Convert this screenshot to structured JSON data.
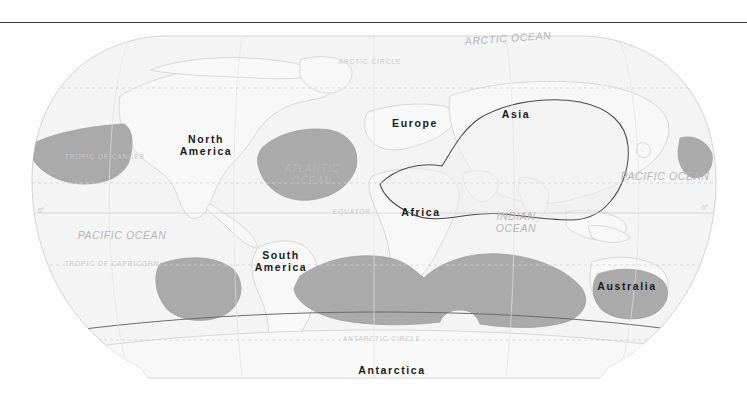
{
  "page": {
    "background": "#ffffff",
    "rule_color": "#3a3a3a"
  },
  "map": {
    "title": "World map with shaded ocean regions",
    "projection": "Robinson",
    "land_fill": "#f6f6f6",
    "ocean_fill": "#f2f2f2",
    "shade_fill": "#aaaaaa",
    "outline_color": "#c9c9c9",
    "grid_color": "#d8d8d8",
    "continents": [
      {
        "id": "north-america",
        "label": "North\nAmerica",
        "lines": [
          "North",
          "America"
        ],
        "x": 205,
        "y": 113
      },
      {
        "id": "south-america",
        "label": "South\nAmerica",
        "lines": [
          "South",
          "America"
        ],
        "x": 281,
        "y": 230
      },
      {
        "id": "europe",
        "label": "Europe",
        "lines": [
          "Europe"
        ],
        "x": 415,
        "y": 99
      },
      {
        "id": "africa",
        "label": "Africa",
        "lines": [
          "Africa"
        ],
        "x": 421,
        "y": 188
      },
      {
        "id": "asia",
        "label": "Asia",
        "lines": [
          "Asia"
        ],
        "x": 516,
        "y": 90
      },
      {
        "id": "australia",
        "label": "Australia",
        "lines": [
          "Australia"
        ],
        "x": 627,
        "y": 262
      },
      {
        "id": "antarctica",
        "label": "Antarctica",
        "lines": [
          "Antarctica"
        ],
        "x": 392,
        "y": 376
      }
    ],
    "oceans": [
      {
        "id": "arctic-ocean",
        "lines": [
          "ARCTIC OCEAN"
        ],
        "x": 508,
        "y": 41
      },
      {
        "id": "atlantic-ocean",
        "lines": [
          "ATLANTIC",
          "OCEAN"
        ],
        "x": 311,
        "y": 171
      },
      {
        "id": "indian-ocean",
        "lines": [
          "INDIAN",
          "OCEAN"
        ],
        "x": 516,
        "y": 219
      },
      {
        "id": "pacific-ocean-west",
        "lines": [
          "PACIFIC OCEAN"
        ],
        "x": 122,
        "y": 238
      },
      {
        "id": "pacific-ocean-east",
        "lines": [
          "PACIFIC OCEAN"
        ],
        "x": 665,
        "y": 179
      }
    ],
    "gridlines": [
      {
        "id": "arctic-circle",
        "label": "ARCTIC CIRCLE",
        "x": 370,
        "y": 64,
        "line_y": 62,
        "style": "dashed"
      },
      {
        "id": "tropic-of-cancer",
        "label": "TROPIC OF CANCER",
        "x": 105,
        "y": 158,
        "line_y": 157,
        "style": "dashed"
      },
      {
        "id": "equator",
        "label": "EQUATOR",
        "x": 352,
        "y": 213,
        "line_y": 213,
        "style": "solid"
      },
      {
        "id": "tropic-of-capricorn",
        "label": "TROPIC OF CAPRICORN",
        "x": 111,
        "y": 265,
        "line_y": 265,
        "style": "dashed"
      },
      {
        "id": "antarctic-circle",
        "label": "ANTARCTIC CIRCLE",
        "x": 381,
        "y": 340,
        "line_y": 340,
        "style": "dashed"
      }
    ],
    "degree_labels": [
      {
        "id": "equator-degree-left",
        "label": "0°",
        "x": 42,
        "y": 210
      },
      {
        "id": "equator-degree-right",
        "label": "0°",
        "x": 706,
        "y": 206
      }
    ]
  }
}
